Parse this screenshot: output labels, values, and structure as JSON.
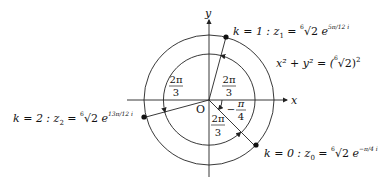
{
  "diagram": {
    "axes": {
      "x_label": "x",
      "y_label": "y",
      "origin_label": "O"
    },
    "circle_equation": {
      "lhs": "x² + y² = (",
      "root_index": "6",
      "radicand": "√2",
      "rhs_close": ")",
      "exponent": "2"
    },
    "roots": [
      {
        "k_label": "k = 0 : z",
        "sub": "0",
        "eq": " = ",
        "root_index": "6",
        "radical": "√2",
        "base": " e",
        "exponent": "−π/4 i",
        "angle_deg": -45
      },
      {
        "k_label": "k = 1 : z",
        "sub": "1",
        "eq": " = ",
        "root_index": "6",
        "radical": "√2",
        "base": " e",
        "exponent": "5π/12 i",
        "angle_deg": 75
      },
      {
        "k_label": "k = 2 : z",
        "sub": "2",
        "eq": " = ",
        "root_index": "6",
        "radical": "√2",
        "base": " e",
        "exponent": "13π/12 i",
        "angle_deg": 195
      }
    ],
    "angle_labels": [
      {
        "num": "2π",
        "den": "3",
        "position": "upper-left"
      },
      {
        "num": "2π",
        "den": "3",
        "position": "upper-right"
      },
      {
        "num": "2π",
        "den": "3",
        "position": "lower"
      },
      {
        "sign": "−",
        "num": "π",
        "den": "4",
        "position": "right"
      }
    ],
    "colors": {
      "stroke": "#222222",
      "text": "#111111",
      "background": "#ffffff"
    }
  }
}
